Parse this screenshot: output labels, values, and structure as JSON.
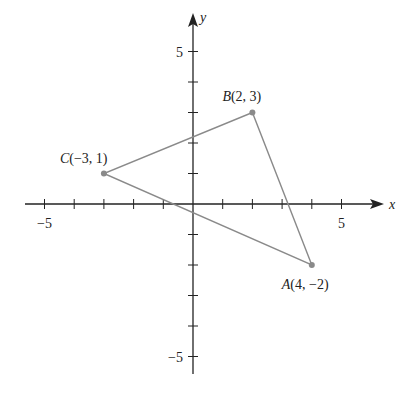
{
  "chart_data": {
    "type": "scatter",
    "title": "",
    "xlabel": "x",
    "ylabel": "y",
    "xlim": [
      -6,
      6
    ],
    "ylim": [
      -6,
      6
    ],
    "x_tick_labels": [
      "-5",
      "5"
    ],
    "y_tick_labels": [
      "5",
      "-5"
    ],
    "grid": false,
    "points": [
      {
        "name": "A",
        "x": 4,
        "y": -2,
        "label": "A(4, −2)"
      },
      {
        "name": "B",
        "x": 2,
        "y": 3,
        "label": "B(2, 3)"
      },
      {
        "name": "C",
        "x": -3,
        "y": 1,
        "label": "C(−3, 1)"
      }
    ],
    "polygon": [
      "A",
      "B",
      "C"
    ],
    "colors": {
      "axis": "#222222",
      "triangle": "#8a8a8a",
      "point": "#8a8a8a"
    }
  }
}
